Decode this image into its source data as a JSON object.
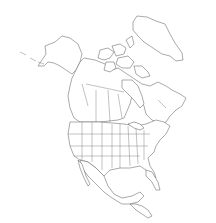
{
  "map": {
    "title": "",
    "region": "North America",
    "style": "outline",
    "line_color": "#555555",
    "background_color": "#ffffff",
    "features": [
      {
        "name": "Greenland"
      },
      {
        "name": "Alaska"
      },
      {
        "name": "Canada"
      },
      {
        "name": "Canadian Arctic Archipelago"
      },
      {
        "name": "Contiguous United States"
      },
      {
        "name": "Mexico"
      },
      {
        "name": "Central America"
      },
      {
        "name": "Florida"
      }
    ],
    "labels": []
  }
}
